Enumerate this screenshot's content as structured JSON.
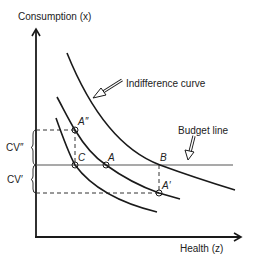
{
  "diagram": {
    "type": "economics-indifference-curve-diagram",
    "axes": {
      "y_label": "Consumption (x)",
      "x_label": "Health (z)"
    },
    "annotations": {
      "indifference_curve": "Indifference curve",
      "budget_line": "Budget line"
    },
    "points": {
      "A": "A",
      "B": "B",
      "C": "C",
      "A_double_prime": "A″",
      "A_prime": "A′"
    },
    "brackets": {
      "cv_double_prime": "CV″",
      "cv_prime": "CV′"
    },
    "curves": [
      {
        "name": "upper-indifference-curve",
        "passes_through": [
          "B"
        ]
      },
      {
        "name": "middle-indifference-curve",
        "passes_through": [
          "A″",
          "A",
          "A′"
        ]
      },
      {
        "name": "lower-indifference-curve",
        "passes_through": [
          "C"
        ]
      }
    ],
    "colors": {
      "line": "#1a1a1a",
      "budget_line": "#555555",
      "text": "#222222"
    }
  }
}
